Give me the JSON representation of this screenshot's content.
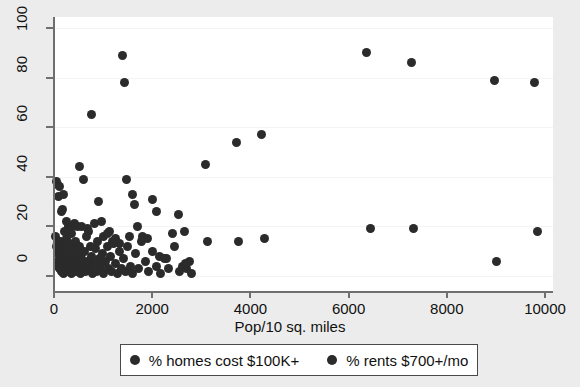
{
  "chart_data": {
    "type": "scatter",
    "title": "",
    "xlabel": "Pop/10 sq. miles",
    "ylabel": "",
    "xlim": [
      0,
      10000
    ],
    "ylim": [
      0,
      100
    ],
    "xticks": [
      0,
      2000,
      4000,
      6000,
      8000,
      10000
    ],
    "yticks": [
      0,
      20,
      40,
      60,
      80,
      100
    ],
    "xticklabels": [
      "0",
      "2000",
      "4000",
      "6000",
      "8000",
      "10000"
    ],
    "yticklabels": [
      "0",
      "20",
      "40",
      "60",
      "80",
      "100"
    ],
    "grid": "faint-horizontal",
    "legend_position": "below-axis",
    "marker_color": "#2b2b2b",
    "plot_bgcolor": "#ffffff",
    "figure_bgcolor": "#ececec",
    "series": [
      {
        "name": "% homes cost $100K+",
        "marker_color": "#2b2b2b",
        "points": [
          [
            60,
            38
          ],
          [
            70,
            37
          ],
          [
            95,
            32
          ],
          [
            110,
            36
          ],
          [
            150,
            26
          ],
          [
            170,
            27
          ],
          [
            200,
            33
          ],
          [
            250,
            22
          ],
          [
            300,
            20
          ],
          [
            330,
            19
          ],
          [
            360,
            17
          ],
          [
            420,
            21
          ],
          [
            470,
            20
          ],
          [
            520,
            44
          ],
          [
            560,
            20
          ],
          [
            610,
            39
          ],
          [
            680,
            19
          ],
          [
            700,
            18
          ],
          [
            760,
            65
          ],
          [
            830,
            21
          ],
          [
            900,
            30
          ],
          [
            960,
            22
          ],
          [
            1010,
            16
          ],
          [
            1080,
            17
          ],
          [
            1130,
            18
          ],
          [
            1200,
            14
          ],
          [
            1260,
            15
          ],
          [
            1330,
            13
          ],
          [
            1400,
            89
          ],
          [
            1430,
            78
          ],
          [
            1470,
            39
          ],
          [
            1540,
            16
          ],
          [
            1600,
            33
          ],
          [
            1640,
            29
          ],
          [
            1700,
            20
          ],
          [
            1800,
            16
          ],
          [
            1900,
            15
          ],
          [
            2010,
            31
          ],
          [
            2090,
            26
          ],
          [
            2150,
            8
          ],
          [
            2300,
            7
          ],
          [
            2420,
            17
          ],
          [
            2530,
            25
          ],
          [
            2620,
            4
          ],
          [
            2660,
            18
          ],
          [
            2700,
            3
          ],
          [
            2760,
            6
          ],
          [
            3080,
            45
          ],
          [
            3130,
            14
          ],
          [
            3710,
            54
          ],
          [
            3760,
            14
          ],
          [
            4230,
            57
          ],
          [
            4290,
            15
          ],
          [
            6360,
            90
          ],
          [
            6450,
            19
          ],
          [
            7280,
            86
          ],
          [
            7320,
            19
          ],
          [
            8980,
            79
          ],
          [
            9020,
            6
          ],
          [
            9780,
            78
          ],
          [
            9840,
            18
          ]
        ]
      },
      {
        "name": "% rents $700+/mo",
        "marker_color": "#2b2b2b",
        "points": [
          [
            40,
            16
          ],
          [
            55,
            12
          ],
          [
            65,
            9
          ],
          [
            75,
            6
          ],
          [
            85,
            13
          ],
          [
            95,
            4
          ],
          [
            105,
            10
          ],
          [
            115,
            3
          ],
          [
            125,
            7
          ],
          [
            135,
            14
          ],
          [
            145,
            2
          ],
          [
            155,
            11
          ],
          [
            165,
            5
          ],
          [
            175,
            8
          ],
          [
            185,
            1
          ],
          [
            195,
            12
          ],
          [
            205,
            6
          ],
          [
            215,
            18
          ],
          [
            225,
            3
          ],
          [
            240,
            9
          ],
          [
            255,
            15
          ],
          [
            265,
            4
          ],
          [
            280,
            10
          ],
          [
            295,
            2
          ],
          [
            310,
            7
          ],
          [
            325,
            13
          ],
          [
            340,
            5
          ],
          [
            355,
            1
          ],
          [
            375,
            11
          ],
          [
            390,
            8
          ],
          [
            405,
            3
          ],
          [
            425,
            6
          ],
          [
            440,
            14
          ],
          [
            460,
            2
          ],
          [
            480,
            9
          ],
          [
            500,
            5
          ],
          [
            520,
            12
          ],
          [
            545,
            1
          ],
          [
            565,
            7
          ],
          [
            590,
            4
          ],
          [
            615,
            10
          ],
          [
            640,
            2
          ],
          [
            665,
            16
          ],
          [
            690,
            6
          ],
          [
            715,
            3
          ],
          [
            740,
            12
          ],
          [
            765,
            8
          ],
          [
            790,
            1
          ],
          [
            815,
            5
          ],
          [
            845,
            11
          ],
          [
            870,
            2
          ],
          [
            895,
            14
          ],
          [
            920,
            7
          ],
          [
            950,
            4
          ],
          [
            980,
            9
          ],
          [
            1010,
            1
          ],
          [
            1045,
            6
          ],
          [
            1080,
            12
          ],
          [
            1110,
            3
          ],
          [
            1145,
            8
          ],
          [
            1180,
            2
          ],
          [
            1215,
            13
          ],
          [
            1250,
            5
          ],
          [
            1290,
            1
          ],
          [
            1330,
            10
          ],
          [
            1370,
            3
          ],
          [
            1410,
            7
          ],
          [
            1450,
            2
          ],
          [
            1500,
            12
          ],
          [
            1550,
            4
          ],
          [
            1600,
            1
          ],
          [
            1660,
            9
          ],
          [
            1720,
            3
          ],
          [
            1790,
            14
          ],
          [
            1860,
            6
          ],
          [
            1930,
            2
          ],
          [
            2000,
            10
          ],
          [
            2080,
            4
          ],
          [
            2160,
            1
          ],
          [
            2250,
            7
          ],
          [
            2340,
            3
          ],
          [
            2450,
            12
          ],
          [
            2560,
            2
          ],
          [
            2680,
            5
          ],
          [
            2810,
            1
          ]
        ]
      }
    ]
  },
  "axis": {
    "x_title": "Pop/10 sq. miles"
  },
  "legend": {
    "entries": [
      {
        "label": "% homes cost $100K+",
        "marker": "filled-circle-marker"
      },
      {
        "label": "% rents $700+/mo",
        "marker": "filled-circle-marker"
      }
    ]
  }
}
